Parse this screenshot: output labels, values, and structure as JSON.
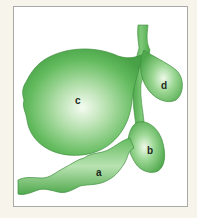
{
  "figure": {
    "background_color": "#f7f4ec",
    "frame_color": "#a9a9a6",
    "shape_color": "#5cb85a",
    "shape_edge_color": "#3f8f3f",
    "highlight_color": "#f2fbef"
  },
  "labels": {
    "a": "a",
    "b": "b",
    "c": "c",
    "d": "d"
  }
}
